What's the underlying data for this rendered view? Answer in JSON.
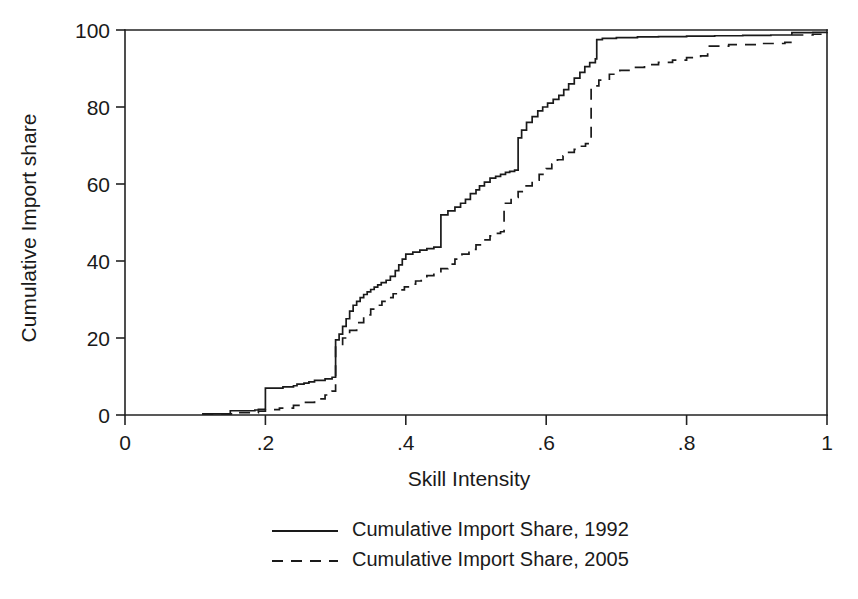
{
  "chart_data": {
    "type": "line",
    "title": "",
    "subtitle": "",
    "xlabel": "Skill Intensity",
    "ylabel": "Cumulative Import share",
    "xlim": [
      0,
      1
    ],
    "ylim": [
      0,
      100
    ],
    "xticks": [
      0,
      0.2,
      0.4,
      0.6,
      0.8,
      1
    ],
    "xticklabels": [
      "0",
      ".2",
      ".4",
      ".6",
      ".8",
      "1"
    ],
    "yticks": [
      0,
      20,
      40,
      60,
      80,
      100
    ],
    "yticklabels": [
      "0",
      "20",
      "40",
      "60",
      "80",
      "100"
    ],
    "grid": false,
    "legend_position": "below-axis-center",
    "series": [
      {
        "name": "Cumulative Import Share, 1992",
        "style": "solid",
        "color": "#1a1a1a",
        "x": [
          0.11,
          0.15,
          0.15,
          0.185,
          0.19,
          0.2,
          0.2,
          0.225,
          0.24,
          0.245,
          0.255,
          0.262,
          0.27,
          0.285,
          0.295,
          0.3,
          0.3,
          0.305,
          0.31,
          0.315,
          0.32,
          0.325,
          0.33,
          0.335,
          0.34,
          0.345,
          0.35,
          0.355,
          0.36,
          0.365,
          0.372,
          0.378,
          0.385,
          0.39,
          0.395,
          0.4,
          0.4,
          0.41,
          0.42,
          0.43,
          0.44,
          0.45,
          0.45,
          0.46,
          0.47,
          0.478,
          0.485,
          0.492,
          0.5,
          0.505,
          0.512,
          0.52,
          0.528,
          0.535,
          0.542,
          0.548,
          0.555,
          0.56,
          0.565,
          0.572,
          0.58,
          0.588,
          0.595,
          0.602,
          0.61,
          0.618,
          0.625,
          0.632,
          0.64,
          0.648,
          0.655,
          0.662,
          0.67,
          0.672,
          0.68,
          0.7,
          0.73,
          0.76,
          0.8,
          0.84,
          0.88,
          0.92,
          0.95,
          0.95,
          0.98,
          1.0
        ],
        "y": [
          0.3,
          0.5,
          1.1,
          1.3,
          1.5,
          1.8,
          7.0,
          7.3,
          7.6,
          8.0,
          8.3,
          8.6,
          9.0,
          9.4,
          9.8,
          10.2,
          19.5,
          21.0,
          23.0,
          25.0,
          27.0,
          28.5,
          29.5,
          30.5,
          31.3,
          32.0,
          32.6,
          33.2,
          33.8,
          34.4,
          35.0,
          36.0,
          37.5,
          39.0,
          40.5,
          41.5,
          41.8,
          42.3,
          42.8,
          43.2,
          43.6,
          44.0,
          52.0,
          53.0,
          54.0,
          55.0,
          56.0,
          57.5,
          58.5,
          59.5,
          60.5,
          61.5,
          62.0,
          62.5,
          63.0,
          63.3,
          63.6,
          72.0,
          74.0,
          76.0,
          77.5,
          79.0,
          80.0,
          81.0,
          82.0,
          83.0,
          84.5,
          86.0,
          87.5,
          89.0,
          90.5,
          91.5,
          92.5,
          97.5,
          97.8,
          98.0,
          98.2,
          98.3,
          98.4,
          98.5,
          98.6,
          98.7,
          98.8,
          99.3,
          99.4,
          99.5
        ]
      },
      {
        "name": "Cumulative Import Share, 2005",
        "style": "dashed",
        "color": "#1a1a1a",
        "x": [
          0.11,
          0.16,
          0.19,
          0.2,
          0.22,
          0.24,
          0.255,
          0.27,
          0.285,
          0.295,
          0.3,
          0.3,
          0.31,
          0.32,
          0.33,
          0.34,
          0.35,
          0.358,
          0.366,
          0.374,
          0.382,
          0.39,
          0.398,
          0.406,
          0.414,
          0.422,
          0.43,
          0.44,
          0.45,
          0.46,
          0.47,
          0.48,
          0.49,
          0.5,
          0.51,
          0.52,
          0.528,
          0.535,
          0.54,
          0.54,
          0.55,
          0.56,
          0.57,
          0.58,
          0.59,
          0.6,
          0.608,
          0.616,
          0.624,
          0.632,
          0.64,
          0.648,
          0.656,
          0.664,
          0.664,
          0.675,
          0.69,
          0.705,
          0.72,
          0.74,
          0.76,
          0.78,
          0.8,
          0.82,
          0.83,
          0.86,
          0.9,
          0.94,
          0.95,
          0.95,
          0.98,
          1.0
        ],
        "y": [
          0.3,
          0.6,
          1.0,
          1.4,
          1.8,
          2.5,
          3.3,
          4.2,
          5.2,
          6.2,
          6.8,
          18.0,
          20.0,
          22.0,
          24.0,
          26.0,
          27.5,
          28.5,
          29.5,
          30.5,
          31.5,
          32.5,
          33.3,
          34.0,
          34.8,
          35.5,
          36.2,
          37.0,
          38.0,
          39.2,
          40.5,
          41.8,
          43.0,
          44.2,
          45.5,
          46.5,
          47.2,
          47.6,
          47.9,
          55.0,
          56.5,
          58.0,
          59.5,
          61.0,
          62.5,
          64.0,
          65.2,
          66.3,
          67.3,
          68.2,
          69.0,
          69.8,
          70.5,
          71.0,
          85.5,
          87.0,
          88.5,
          89.5,
          90.3,
          91.0,
          91.6,
          92.2,
          92.8,
          93.3,
          95.8,
          96.2,
          96.5,
          96.8,
          96.9,
          98.7,
          98.9,
          99.0
        ]
      }
    ]
  },
  "legend": {
    "items": [
      {
        "label": "Cumulative Import Share, 1992",
        "style": "solid"
      },
      {
        "label": "Cumulative Import Share, 2005",
        "style": "dashed"
      }
    ]
  },
  "colors": {
    "line": "#1a1a1a",
    "axis": "#222222",
    "background": "#ffffff"
  }
}
